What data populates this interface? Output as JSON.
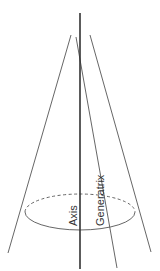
{
  "diagram": {
    "type": "cone-geometry",
    "labels": {
      "axis": "Axis",
      "generatrix": "Generatrix"
    },
    "colors": {
      "line": "#555555",
      "axis": "#333333",
      "background": "#ffffff"
    }
  }
}
